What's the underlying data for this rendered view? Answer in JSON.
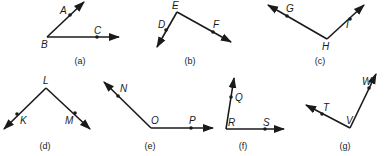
{
  "diagram": {
    "angles": [
      {
        "caption": "(a)",
        "vertex": {
          "label": "B",
          "x": 47,
          "y": 37,
          "lx": 41,
          "ly": 48
        },
        "rays": [
          {
            "end": [
              84,
              2
            ],
            "point": {
              "label": "A",
              "x": 70,
              "y": 15,
              "lx": 60,
              "ly": 14
            }
          },
          {
            "end": [
              119,
              37
            ],
            "point": {
              "label": "C",
              "x": 97,
              "y": 37,
              "lx": 94,
              "ly": 34
            }
          }
        ],
        "caption_pos": [
          80,
          64
        ]
      },
      {
        "caption": "(b)",
        "vertex": {
          "label": "E",
          "x": 177,
          "y": 12,
          "lx": 172,
          "ly": 9
        },
        "rays": [
          {
            "end": [
              157,
              47
            ],
            "point": {
              "label": "D",
              "x": 166,
              "y": 30,
              "lx": 158,
              "ly": 28
            }
          },
          {
            "end": [
              231,
              42
            ],
            "point": {
              "label": "F",
              "x": 213,
              "y": 32,
              "lx": 213,
              "ly": 28
            }
          }
        ],
        "caption_pos": [
          190,
          64
        ]
      },
      {
        "caption": "(c)",
        "vertex": {
          "label": "H",
          "x": 327,
          "y": 39,
          "lx": 322,
          "ly": 50
        },
        "rays": [
          {
            "end": [
              268,
              5
            ],
            "point": {
              "label": "G",
              "x": 287,
              "y": 16,
              "lx": 286,
              "ly": 12
            }
          },
          {
            "end": [
              364,
              5
            ],
            "point": {
              "label": "I",
              "x": 350,
              "y": 19,
              "lx": 346,
              "ly": 28
            }
          }
        ],
        "caption_pos": [
          320,
          64
        ]
      },
      {
        "caption": "(d)",
        "vertex": {
          "label": "L",
          "x": 46,
          "y": 88,
          "lx": 43,
          "ly": 84
        },
        "rays": [
          {
            "end": [
              4,
              129
            ],
            "point": {
              "label": "K",
              "x": 17,
              "y": 114,
              "lx": 20,
              "ly": 124
            }
          },
          {
            "end": [
              90,
              129
            ],
            "point": {
              "label": "M",
              "x": 75,
              "y": 113,
              "lx": 65,
              "ly": 124
            }
          }
        ],
        "caption_pos": [
          45,
          149
        ]
      },
      {
        "caption": "(e)",
        "vertex": {
          "label": "O",
          "x": 151,
          "y": 128,
          "lx": 151,
          "ly": 124
        },
        "rays": [
          {
            "end": [
              104,
              82
            ],
            "point": {
              "label": "N",
              "x": 118,
              "y": 96,
              "lx": 120,
              "ly": 92
            }
          },
          {
            "end": [
              213,
              128
            ],
            "point": {
              "label": "P",
              "x": 191,
              "y": 128,
              "lx": 189,
              "ly": 124
            }
          }
        ],
        "caption_pos": [
          150,
          149
        ]
      },
      {
        "caption": "(f)",
        "vertex": {
          "label": "R",
          "x": 226,
          "y": 129,
          "lx": 228,
          "ly": 126
        },
        "rays": [
          {
            "end": [
              234,
              78
            ],
            "point": {
              "label": "Q",
              "x": 231,
              "y": 97,
              "lx": 235,
              "ly": 101
            }
          },
          {
            "end": [
              284,
              129
            ],
            "point": {
              "label": "S",
              "x": 265,
              "y": 129,
              "lx": 263,
              "ly": 126
            }
          }
        ],
        "caption_pos": [
          243,
          149
        ]
      },
      {
        "caption": "(g)",
        "vertex": {
          "label": "V",
          "x": 350,
          "y": 128,
          "lx": 346,
          "ly": 124
        },
        "rays": [
          {
            "end": [
              306,
              105
            ],
            "point": {
              "label": "T",
              "x": 322,
              "y": 114,
              "lx": 323,
              "ly": 111
            }
          },
          {
            "end": [
              376,
              74
            ],
            "point": {
              "label": "W",
              "x": 369,
              "y": 88,
              "lx": 362,
              "ly": 85
            }
          }
        ],
        "caption_pos": [
          345,
          149
        ]
      }
    ]
  }
}
